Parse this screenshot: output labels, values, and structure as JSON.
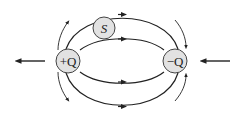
{
  "diagram": {
    "type": "electric-field-lines",
    "charges": [
      {
        "id": "positive",
        "label": "+Q",
        "color": "#e2e2e2"
      },
      {
        "id": "negative",
        "label": "−Q",
        "color": "#e2e2e2"
      }
    ],
    "surface": {
      "label": "S",
      "color": "#e2e2e2"
    },
    "external_arrows": [
      {
        "side": "left",
        "direction": "left"
      },
      {
        "side": "right",
        "direction": "left"
      }
    ],
    "line_color": "#222222"
  }
}
